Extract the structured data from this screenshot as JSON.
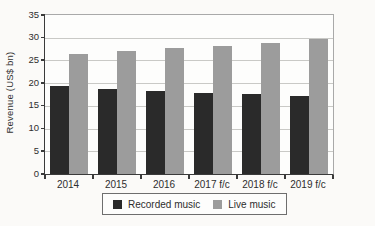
{
  "figure": {
    "background": "#fbfaf8",
    "plot_border_color": "#a9a9a9",
    "axis_color": "#3a3a3a",
    "gridline_color": "#c9c9c6"
  },
  "chart_data": {
    "type": "bar",
    "title": "",
    "xlabel": "",
    "ylabel": "Revenue (US$ bn)",
    "categories": [
      "2014",
      "2015",
      "2016",
      "2017 f/c",
      "2018 f/c",
      "2019 f/c"
    ],
    "series": [
      {
        "name": "Recorded music",
        "color": "#2a2a2a",
        "values": [
          19.3,
          18.8,
          18.3,
          17.9,
          17.6,
          17.2
        ]
      },
      {
        "name": "Live music",
        "color": "#9c9c9c",
        "values": [
          26.4,
          27.0,
          27.7,
          28.2,
          28.9,
          29.8
        ]
      }
    ],
    "ylim": [
      0,
      35
    ],
    "yticks": [
      0,
      5,
      10,
      15,
      20,
      25,
      30,
      35
    ],
    "grid": true,
    "legend_position": "bottom"
  }
}
